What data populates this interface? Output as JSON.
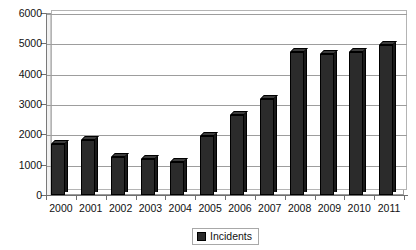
{
  "chart_data": {
    "type": "bar",
    "title": "",
    "subtitle": "",
    "xlabel": "",
    "ylabel": "",
    "categories": [
      "2000",
      "2001",
      "2002",
      "2003",
      "2004",
      "2005",
      "2006",
      "2007",
      "2008",
      "2009",
      "2010",
      "2011"
    ],
    "series": [
      {
        "name": "Incidents",
        "values": [
          1680,
          1800,
          1250,
          1200,
          1100,
          1960,
          2650,
          3180,
          4700,
          4650,
          4700,
          4950
        ],
        "color": "#2b2b2b"
      }
    ],
    "ylim": [
      0,
      6000
    ],
    "ytick_values": [
      0,
      1000,
      2000,
      3000,
      4000,
      5000,
      6000
    ],
    "ytick_labels": [
      "0",
      "1000",
      "2000",
      "3000",
      "4000",
      "5000",
      "6000"
    ],
    "grid": true,
    "grid_axis": "y",
    "legend_position": "bottom",
    "legend_entries": [
      "Incidents"
    ],
    "style": "3d-column"
  },
  "legend": {
    "swatch_name": "incidents-color-swatch",
    "label": "Incidents"
  },
  "colors": {
    "bar": "#2b2b2b",
    "bar_side": "#1a1a1a",
    "bar_top": "#3c3c3c",
    "grid": "#9d9d9d",
    "axis": "#6e6e6e",
    "background": "#ffffff",
    "text": "#111111"
  }
}
